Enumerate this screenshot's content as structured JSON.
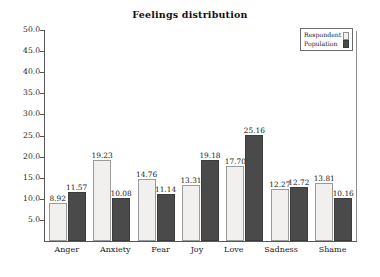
{
  "chart_data": {
    "type": "bar",
    "title": "Feelings distribution",
    "xlabel": "",
    "ylabel": "",
    "ylim": [
      0,
      50
    ],
    "yticks": [
      "5.0",
      "10.0",
      "15.0",
      "20.0",
      "25.0",
      "30.0",
      "35.0",
      "40.0",
      "45.0",
      "50.0"
    ],
    "ytick_values": [
      5,
      10,
      15,
      20,
      25,
      30,
      35,
      40,
      45,
      50
    ],
    "grid": false,
    "legend_position": "upper-right",
    "categories": [
      "Anger",
      "Anxiety",
      "Fear",
      "Joy",
      "Love",
      "Sadness",
      "Shame"
    ],
    "series": [
      {
        "name": "Respondent",
        "color": "#f1f0ee",
        "values": [
          8.92,
          19.23,
          14.76,
          13.31,
          17.7,
          12.27,
          13.81
        ],
        "labels": [
          "8.92",
          "19.23",
          "14.76",
          "13.31",
          "17.70",
          "12.27",
          "13.81"
        ]
      },
      {
        "name": "Population",
        "color": "#4a4a4a",
        "values": [
          11.57,
          10.08,
          11.14,
          19.18,
          25.16,
          12.72,
          10.16
        ],
        "labels": [
          "11.57",
          "10.08",
          "11.14",
          "19.18",
          "25.16",
          "12.72",
          "10.16"
        ]
      }
    ]
  },
  "legend": {
    "entries": [
      {
        "label": "Respondent",
        "swatch": "respondent"
      },
      {
        "label": "Population",
        "swatch": "population"
      }
    ]
  }
}
